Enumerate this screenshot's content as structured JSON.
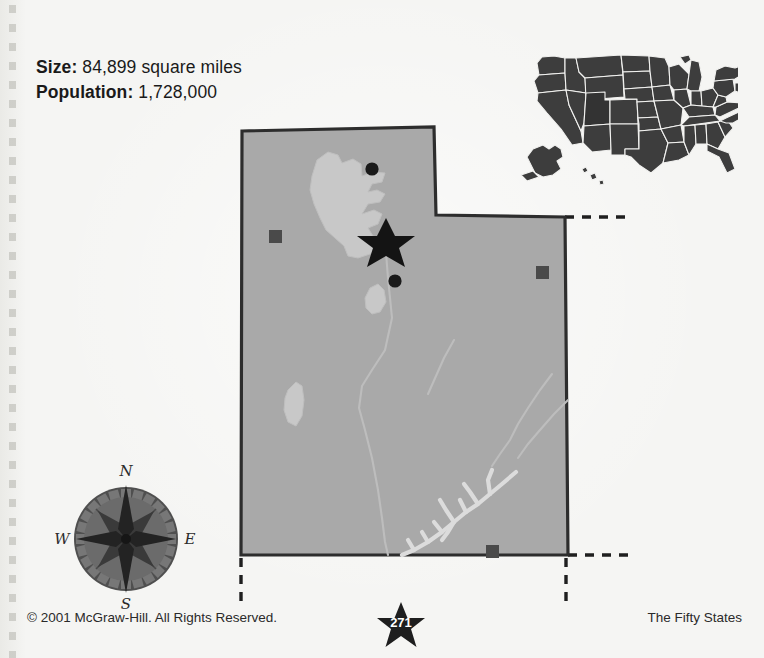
{
  "page": {
    "background_color": "#f5f5f3",
    "width": 764,
    "height": 658
  },
  "stats": {
    "size_label": "Size:",
    "size_value": "84,899 square miles",
    "population_label": "Population:",
    "population_value": "1,728,000"
  },
  "state_map": {
    "state_name": "Utah",
    "fill_color": "#a9a9a9",
    "border_color": "#2d2d2d",
    "water_color": "#c8c8c8",
    "capital_marker": "capital-star",
    "city_marker": "city-dot",
    "landmark_marker": "landmark-square",
    "features": {
      "great_salt_lake": "Great Salt Lake",
      "utah_lake": "Utah Lake",
      "sevier_lake": "Sevier Lake",
      "lake_powell": "Lake Powell",
      "colorado_river": "Colorado River",
      "green_river": "Green River"
    },
    "markers": {
      "capitals": [
        {
          "name": "capital-star",
          "x": 163,
          "y": 119
        }
      ],
      "cities": [
        {
          "name": "city-dot-north",
          "x": 148,
          "y": 50
        },
        {
          "name": "city-dot-south",
          "x": 172,
          "y": 162
        }
      ],
      "landmarks": [
        {
          "name": "landmark-square-west",
          "x": 53,
          "y": 118
        },
        {
          "name": "landmark-square-east",
          "x": 320,
          "y": 155
        },
        {
          "name": "landmark-square-southeast",
          "x": 270,
          "y": 434
        }
      ]
    }
  },
  "us_inset": {
    "label": "united-states-locator",
    "land_color": "#3d3d3d",
    "border_color": "#f2f2f0"
  },
  "compass": {
    "north": "N",
    "east": "E",
    "south": "S",
    "west": "W",
    "ring_color": "#5a5a5a",
    "face_color": "#6e6e6e",
    "star_color": "#2a2a2a"
  },
  "footer": {
    "copyright": "© 2001 McGraw-Hill. All Rights Reserved.",
    "series": "The Fifty States",
    "page_number": "271",
    "badge_color": "#1e1e1e"
  }
}
